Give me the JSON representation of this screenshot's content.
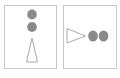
{
  "panels": [
    {
      "id": "left",
      "orientation": "vertical",
      "circles": 2,
      "triangle_direction": "up"
    },
    {
      "id": "right",
      "orientation": "horizontal",
      "circles": 2,
      "triangle_direction": "right"
    }
  ],
  "colors": {
    "background": "#ffffff",
    "panel_border": "#c8c8c8",
    "circle_fill": "#8a8a8a",
    "triangle_stroke": "#a0a0a0"
  }
}
